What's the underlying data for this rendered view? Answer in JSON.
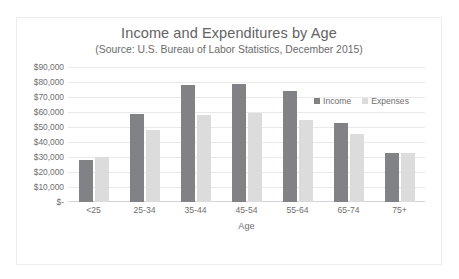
{
  "chart_data": {
    "type": "bar",
    "title": "Income and Expenditures by Age",
    "subtitle": "(Source: U.S. Bureau of Labor Statistics, December 2015)",
    "xlabel": "Age",
    "ylabel": "",
    "categories": [
      "<25",
      "25-34",
      "35-44",
      "45-54",
      "55-64",
      "65-74",
      "75+"
    ],
    "series": [
      {
        "name": "Income",
        "color": "#808285",
        "values": [
          28000,
          58500,
          78000,
          78500,
          74000,
          52500,
          33000
        ]
      },
      {
        "name": "Expenses",
        "color": "#dcdcdd",
        "values": [
          30000,
          48000,
          58000,
          59500,
          54500,
          45500,
          33000
        ]
      }
    ],
    "ylim": [
      0,
      90000
    ],
    "ytick_values": [
      90000,
      80000,
      70000,
      60000,
      50000,
      40000,
      30000,
      20000,
      10000,
      0
    ],
    "ytick_labels": [
      "$90,000",
      "$80,000",
      "$70,000",
      "$60,000",
      "$50,000",
      "$40,000",
      "$30,000",
      "$20,000",
      "$10,000",
      "$-"
    ],
    "grid": true,
    "legend_position": "top-right",
    "legend_entries": [
      "Income",
      "Expenses"
    ]
  }
}
